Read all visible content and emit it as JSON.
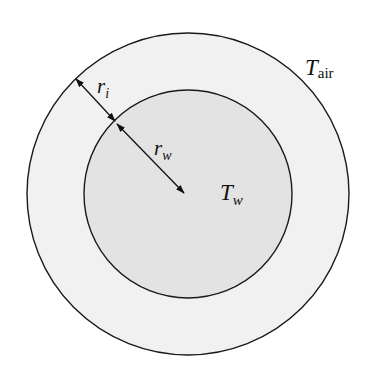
{
  "diagram": {
    "outer_region": {
      "label_main": "T",
      "label_sub": "air",
      "fill": "#f1f1f1",
      "stroke": "#1a1a1a"
    },
    "inner_region": {
      "label_main": "T",
      "label_sub": "w",
      "fill": "#e3e3e3",
      "stroke": "#1a1a1a"
    },
    "dimensions": [
      {
        "label_main": "r",
        "label_sub": "i",
        "meaning": "insulation thickness"
      },
      {
        "label_main": "r",
        "label_sub": "w",
        "meaning": "inner radius"
      }
    ],
    "geometry": {
      "center": [
        188,
        194
      ],
      "outer_radius": 161,
      "inner_radius": 104
    }
  }
}
